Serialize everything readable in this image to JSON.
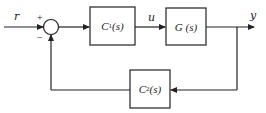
{
  "diagram": {
    "type": "feedback-control-block-diagram",
    "signals": {
      "input": "r",
      "control": "u",
      "output": "y"
    },
    "summing_junction": {
      "plus_sign": "+",
      "minus_sign": "−"
    },
    "blocks": [
      {
        "id": "C1",
        "name": "C",
        "sub": "1",
        "arg": "(s)"
      },
      {
        "id": "G",
        "name": "G",
        "sub": "",
        "arg": " (s)"
      },
      {
        "id": "C2",
        "name": "C",
        "sub": "2",
        "arg": "(s)"
      }
    ],
    "stroke_color": "#222222"
  }
}
